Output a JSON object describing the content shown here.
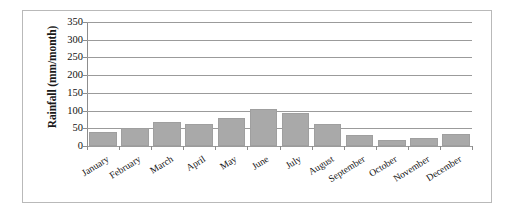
{
  "chart_data": {
    "type": "bar",
    "title": "",
    "xlabel": "",
    "ylabel": "Rainfall (mm/month)",
    "ylim": [
      0,
      350
    ],
    "ytick_step": 50,
    "yticks": [
      0,
      50,
      100,
      150,
      200,
      250,
      300,
      350
    ],
    "ytick_labels": [
      "0",
      "50",
      "100",
      "150",
      "200",
      "250",
      "300",
      "350"
    ],
    "categories": [
      "January",
      "February",
      "March",
      "April",
      "May",
      "June",
      "July",
      "August",
      "September",
      "October",
      "November",
      "December"
    ],
    "values": [
      40,
      50,
      68,
      62,
      80,
      105,
      93,
      62,
      30,
      17,
      22,
      34
    ],
    "grid": true,
    "grid_axis": "y",
    "legend": false,
    "legend_position": "none",
    "bar_color": "#a9a9a9",
    "bar_edge_color": "#9f9f9f",
    "gridline_color": "#9b9b9b",
    "axis_color": "#8d8d8d",
    "text_color": "#111111",
    "background_color": "#ffffff",
    "frame_color": "#b9b9b9",
    "xtick_label_rotation": -32
  }
}
